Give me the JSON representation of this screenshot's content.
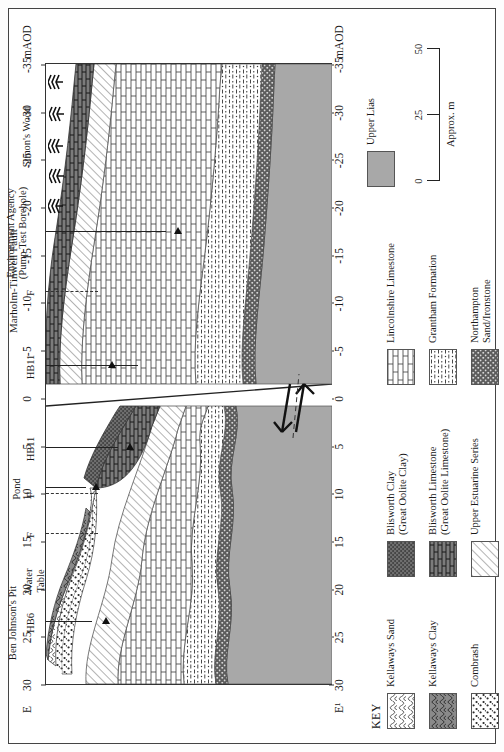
{
  "figure": {
    "type": "geological-cross-section",
    "orientation": "rotated-90",
    "axis_label": "mAOD",
    "left_end_label": "E",
    "right_end_label": "E¹",
    "tick_values": [
      "30",
      "25",
      "20",
      "15",
      "10",
      "5",
      "0",
      "-5",
      "-10",
      "-15",
      "-20",
      "-25",
      "-30",
      "-35"
    ],
    "axis_min": -35,
    "axis_max": 30
  },
  "annotations": {
    "site_left": "Ben Johnson's Pit",
    "site_right": "Simon's Wood",
    "fault_name": "Marholm-Tinwell Fault",
    "borehole_ea": "Environment Agency\n(Pump Test Borehole)",
    "boreholes": [
      {
        "id": "HB6"
      },
      {
        "id": "HB11"
      },
      {
        "id": "HB11"
      }
    ],
    "fault_marks": [
      "F",
      "F",
      "F"
    ],
    "pond": "Pond",
    "water_table": "Water\nTable"
  },
  "key": {
    "title": "KEY",
    "columns": [
      [
        {
          "name": "Kellaways Sand",
          "pattern": "net-open",
          "color": "#ffffff"
        },
        {
          "name": "Kellaways Clay",
          "pattern": "net-dark",
          "color": "#8a8a8a"
        },
        {
          "name": "Combrash",
          "pattern": "speckle",
          "color": "#ffffff"
        }
      ],
      [
        {
          "name": "Blisworth Clay\n(Great Oolite Clay)",
          "pattern": "dense-dot",
          "color": "#6e6e6e"
        },
        {
          "name": "Blisworth Limestone\n(Great Oolite Limestone)",
          "pattern": "brick-dark",
          "color": "#777777"
        },
        {
          "name": "Upper Estuarine Series",
          "pattern": "fine-diagonal",
          "color": "#ffffff"
        }
      ],
      [
        {
          "name": "Lincolnshire Limestone",
          "pattern": "brick-open",
          "color": "#ffffff"
        },
        {
          "name": "Grantham Formation",
          "pattern": "dash-dot",
          "color": "#ffffff"
        },
        {
          "name": "Northampton\nSand/Ironstone",
          "pattern": "dark-speckle",
          "color": "#5c5c5c"
        }
      ],
      [
        {
          "name": "Upper Lias",
          "pattern": "solid-grey",
          "color": "#a8a8a8"
        }
      ]
    ]
  },
  "scale": {
    "caption": "Approx. m",
    "ticks": [
      "0",
      "25",
      "50"
    ],
    "min": 0,
    "max": 50
  }
}
